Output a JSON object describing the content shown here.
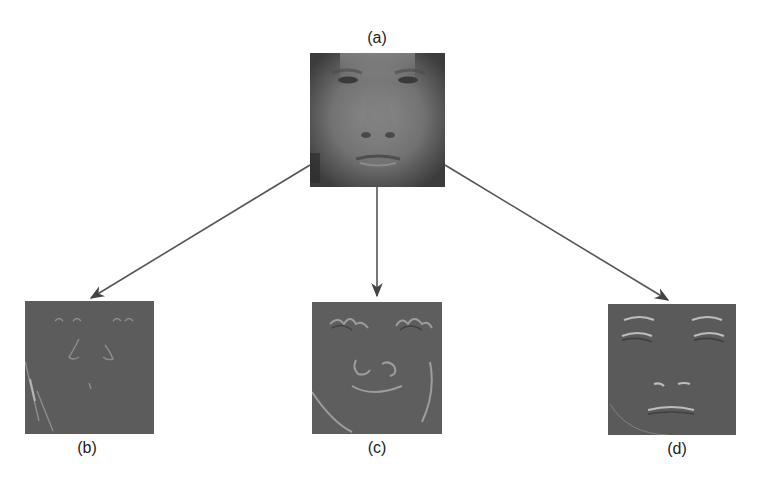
{
  "diagram": {
    "source_panel": {
      "label": "(a)",
      "description": "original grayscale face image"
    },
    "output_panels": [
      {
        "label": "(b)",
        "description": "filtered face response (edges, first orientation)"
      },
      {
        "label": "(c)",
        "description": "filtered face response (edges, second orientation)"
      },
      {
        "label": "(d)",
        "description": "filtered face response (horizontal features)"
      }
    ],
    "arrow_color": "#555555",
    "background_color": "#ffffff"
  }
}
